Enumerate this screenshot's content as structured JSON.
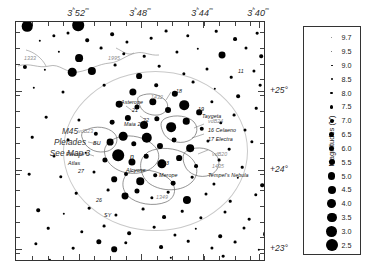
{
  "chart_data": {
    "type": "scatter",
    "xlabel": "Right Ascension",
    "ylabel": "Declination",
    "xlim": [
      "3h54m",
      "3h38m"
    ],
    "ylim": [
      "+22.6",
      "+25.6"
    ],
    "grid": false,
    "legend_position": "right",
    "ra_ticks": [
      "3h52m",
      "3h48m",
      "3h44m",
      "3h40m"
    ],
    "dec_ticks": [
      "+25°",
      "+24°",
      "+23°"
    ],
    "magnitude_scale": [
      9.7,
      9.5,
      9.0,
      8.5,
      8.0,
      7.5,
      7.0,
      6.5,
      6.0,
      5.5,
      5.0,
      4.5,
      4.0,
      3.5,
      3.0,
      2.5
    ],
    "stars": [
      {
        "x": 11,
        "y": 4,
        "mag": 3.6
      },
      {
        "x": 62,
        "y": 3,
        "mag": 2.9
      },
      {
        "x": 38,
        "y": 14,
        "mag": 8.6
      },
      {
        "x": 52,
        "y": 11,
        "mag": 8.8
      },
      {
        "x": 24,
        "y": 19,
        "mag": 9.2
      },
      {
        "x": 71,
        "y": 18,
        "mag": 8.4
      },
      {
        "x": 96,
        "y": 12,
        "mag": 8.3
      },
      {
        "x": 111,
        "y": 20,
        "mag": 8.7
      },
      {
        "x": 135,
        "y": 16,
        "mag": 9.0
      },
      {
        "x": 150,
        "y": 9,
        "mag": 8.9
      },
      {
        "x": 172,
        "y": 14,
        "mag": 8.5
      },
      {
        "x": 200,
        "y": 9,
        "mag": 9.1
      },
      {
        "x": 219,
        "y": 17,
        "mag": 8.2
      },
      {
        "x": 241,
        "y": 11,
        "mag": 9.0
      },
      {
        "x": 43,
        "y": 30,
        "mag": 9.3
      },
      {
        "x": 85,
        "y": 26,
        "mag": 8.9
      },
      {
        "x": 63,
        "y": 36,
        "mag": 5.5
      },
      {
        "x": 108,
        "y": 32,
        "mag": 8.5
      },
      {
        "x": 128,
        "y": 34,
        "mag": 9.1
      },
      {
        "x": 161,
        "y": 30,
        "mag": 8.7
      },
      {
        "x": 182,
        "y": 27,
        "mag": 9.2
      },
      {
        "x": 206,
        "y": 33,
        "mag": 6.1
      },
      {
        "x": 230,
        "y": 26,
        "mag": 8.8
      },
      {
        "x": 245,
        "y": 34,
        "mag": 8.4
      },
      {
        "x": 9,
        "y": 45,
        "mag": 8.0
      },
      {
        "x": 29,
        "y": 48,
        "mag": 9.3
      },
      {
        "x": 56,
        "y": 50,
        "mag": 5.0
      },
      {
        "x": 76,
        "y": 49,
        "mag": 5.2
      },
      {
        "x": 99,
        "y": 43,
        "mag": 8.9
      },
      {
        "x": 123,
        "y": 54,
        "mag": 6.9
      },
      {
        "x": 143,
        "y": 44,
        "mag": 9.0
      },
      {
        "x": 168,
        "y": 52,
        "mag": 8.6
      },
      {
        "x": 191,
        "y": 47,
        "mag": 8.8
      },
      {
        "x": 215,
        "y": 55,
        "mag": 9.1
      },
      {
        "x": 238,
        "y": 49,
        "mag": 8.7
      },
      {
        "x": 18,
        "y": 66,
        "mag": 9.2
      },
      {
        "x": 47,
        "y": 70,
        "mag": 8.8
      },
      {
        "x": 88,
        "y": 63,
        "mag": 9.0
      },
      {
        "x": 117,
        "y": 70,
        "mag": 5.9
      },
      {
        "x": 140,
        "y": 63,
        "mag": 8.4
      },
      {
        "x": 159,
        "y": 72,
        "mag": 6.5
      },
      {
        "x": 177,
        "y": 60,
        "mag": 8.9
      },
      {
        "x": 199,
        "y": 67,
        "mag": 9.2
      },
      {
        "x": 222,
        "y": 74,
        "mag": 8.3
      },
      {
        "x": 244,
        "y": 63,
        "mag": 9.0
      },
      {
        "x": 103,
        "y": 82,
        "mag": 6.3
      },
      {
        "x": 121,
        "y": 85,
        "mag": 7.4
      },
      {
        "x": 137,
        "y": 80,
        "mag": 5.8
      },
      {
        "x": 152,
        "y": 88,
        "mag": 6.8
      },
      {
        "x": 168,
        "y": 83,
        "mag": 4.3
      },
      {
        "x": 183,
        "y": 90,
        "mag": 7.0
      },
      {
        "x": 196,
        "y": 80,
        "mag": 8.6
      },
      {
        "x": 218,
        "y": 93,
        "mag": 8.9
      },
      {
        "x": 240,
        "y": 86,
        "mag": 9.1
      },
      {
        "x": 30,
        "y": 95,
        "mag": 9.0
      },
      {
        "x": 63,
        "y": 98,
        "mag": 8.7
      },
      {
        "x": 96,
        "y": 100,
        "mag": 7.6
      },
      {
        "x": 112,
        "y": 96,
        "mag": 6.6
      },
      {
        "x": 128,
        "y": 103,
        "mag": 5.4
      },
      {
        "x": 141,
        "y": 97,
        "mag": 7.2
      },
      {
        "x": 155,
        "y": 105,
        "mag": 4.2
      },
      {
        "x": 170,
        "y": 99,
        "mag": 6.4
      },
      {
        "x": 186,
        "y": 107,
        "mag": 7.8
      },
      {
        "x": 205,
        "y": 101,
        "mag": 8.5
      },
      {
        "x": 229,
        "y": 108,
        "mag": 8.8
      },
      {
        "x": 16,
        "y": 115,
        "mag": 9.1
      },
      {
        "x": 52,
        "y": 118,
        "mag": 8.9
      },
      {
        "x": 80,
        "y": 112,
        "mag": 7.9
      },
      {
        "x": 94,
        "y": 120,
        "mag": 6.2
      },
      {
        "x": 107,
        "y": 114,
        "mag": 4.9
      },
      {
        "x": 118,
        "y": 122,
        "mag": 7.1
      },
      {
        "x": 131,
        "y": 116,
        "mag": 3.7
      },
      {
        "x": 144,
        "y": 124,
        "mag": 6.7
      },
      {
        "x": 158,
        "y": 118,
        "mag": 7.5
      },
      {
        "x": 174,
        "y": 126,
        "mag": 5.6
      },
      {
        "x": 192,
        "y": 119,
        "mag": 8.7
      },
      {
        "x": 213,
        "y": 127,
        "mag": 9.0
      },
      {
        "x": 236,
        "y": 120,
        "mag": 8.6
      },
      {
        "x": 38,
        "y": 134,
        "mag": 8.8
      },
      {
        "x": 70,
        "y": 131,
        "mag": 9.2
      },
      {
        "x": 89,
        "y": 138,
        "mag": 7.3
      },
      {
        "x": 102,
        "y": 133,
        "mag": 2.9
      },
      {
        "x": 116,
        "y": 140,
        "mag": 6.0
      },
      {
        "x": 130,
        "y": 134,
        "mag": 7.7
      },
      {
        "x": 146,
        "y": 142,
        "mag": 4.5
      },
      {
        "x": 163,
        "y": 136,
        "mag": 6.9
      },
      {
        "x": 180,
        "y": 144,
        "mag": 8.2
      },
      {
        "x": 203,
        "y": 138,
        "mag": 8.9
      },
      {
        "x": 226,
        "y": 145,
        "mag": 9.1
      },
      {
        "x": 13,
        "y": 152,
        "mag": 9.0
      },
      {
        "x": 45,
        "y": 155,
        "mag": 8.5
      },
      {
        "x": 78,
        "y": 150,
        "mag": 8.8
      },
      {
        "x": 98,
        "y": 157,
        "mag": 7.0
      },
      {
        "x": 110,
        "y": 152,
        "mag": 8.1
      },
      {
        "x": 124,
        "y": 159,
        "mag": 5.7
      },
      {
        "x": 139,
        "y": 153,
        "mag": 8.4
      },
      {
        "x": 157,
        "y": 161,
        "mag": 7.6
      },
      {
        "x": 176,
        "y": 155,
        "mag": 9.0
      },
      {
        "x": 198,
        "y": 162,
        "mag": 8.7
      },
      {
        "x": 222,
        "y": 156,
        "mag": 9.2
      },
      {
        "x": 246,
        "y": 163,
        "mag": 8.3
      },
      {
        "x": 60,
        "y": 171,
        "mag": 9.1
      },
      {
        "x": 92,
        "y": 168,
        "mag": 8.9
      },
      {
        "x": 109,
        "y": 174,
        "mag": 6.1
      },
      {
        "x": 121,
        "y": 169,
        "mag": 7.4
      },
      {
        "x": 136,
        "y": 176,
        "mag": 8.6
      },
      {
        "x": 152,
        "y": 170,
        "mag": 9.0
      },
      {
        "x": 171,
        "y": 178,
        "mag": 5.3
      },
      {
        "x": 190,
        "y": 172,
        "mag": 8.8
      },
      {
        "x": 214,
        "y": 179,
        "mag": 9.1
      },
      {
        "x": 240,
        "y": 173,
        "mag": 8.5
      },
      {
        "x": 22,
        "y": 188,
        "mag": 8.4
      },
      {
        "x": 48,
        "y": 192,
        "mag": 9.2
      },
      {
        "x": 73,
        "y": 186,
        "mag": 9.0
      },
      {
        "x": 100,
        "y": 193,
        "mag": 8.7
      },
      {
        "x": 127,
        "y": 187,
        "mag": 8.9
      },
      {
        "x": 148,
        "y": 195,
        "mag": 8.2
      },
      {
        "x": 166,
        "y": 189,
        "mag": 9.1
      },
      {
        "x": 185,
        "y": 196,
        "mag": 8.6
      },
      {
        "x": 209,
        "y": 190,
        "mag": 8.8
      },
      {
        "x": 233,
        "y": 197,
        "mag": 9.0
      },
      {
        "x": 32,
        "y": 206,
        "mag": 9.1
      },
      {
        "x": 66,
        "y": 210,
        "mag": 8.5
      },
      {
        "x": 88,
        "y": 204,
        "mag": 8.9
      },
      {
        "x": 113,
        "y": 211,
        "mag": 8.3
      },
      {
        "x": 138,
        "y": 205,
        "mag": 9.0
      },
      {
        "x": 159,
        "y": 213,
        "mag": 8.7
      },
      {
        "x": 180,
        "y": 207,
        "mag": 9.2
      },
      {
        "x": 204,
        "y": 214,
        "mag": 8.4
      },
      {
        "x": 228,
        "y": 206,
        "mag": 8.8
      },
      {
        "x": 250,
        "y": 212,
        "mag": 6.9
      },
      {
        "x": 20,
        "y": 222,
        "mag": 8.6
      },
      {
        "x": 57,
        "y": 226,
        "mag": 9.0
      },
      {
        "x": 83,
        "y": 220,
        "mag": 7.2
      },
      {
        "x": 98,
        "y": 227,
        "mag": 7.0
      },
      {
        "x": 110,
        "y": 221,
        "mag": 8.5
      },
      {
        "x": 145,
        "y": 225,
        "mag": 8.2
      },
      {
        "x": 172,
        "y": 219,
        "mag": 9.1
      },
      {
        "x": 196,
        "y": 226,
        "mag": 8.7
      },
      {
        "x": 219,
        "y": 220,
        "mag": 8.9
      },
      {
        "x": 243,
        "y": 228,
        "mag": 9.2
      },
      {
        "x": 34,
        "y": 238,
        "mag": 9.3
      },
      {
        "x": 155,
        "y": 236,
        "mag": 9.2
      },
      {
        "x": 207,
        "y": 234,
        "mag": 9.0
      }
    ]
  },
  "axes": {
    "ra_ticks": [
      {
        "label": "3ʰ52ᵐ",
        "x": 63
      },
      {
        "label": "3ʰ48ᵐ",
        "x": 125
      },
      {
        "label": "3ʰ44ᵐ",
        "x": 187
      },
      {
        "label": "3ʰ40ᵐ",
        "x": 243
      }
    ],
    "dec_ticks": [
      {
        "label": "+25°",
        "y": 69
      },
      {
        "label": "+24°",
        "y": 148
      },
      {
        "label": "+23°",
        "y": 227
      }
    ]
  },
  "map_labels": {
    "object_title": [
      "M45",
      "Pleiades",
      "See Map 3"
    ],
    "nebulae": [
      {
        "name": "1333",
        "x": 8,
        "y": 33
      },
      {
        "name": "1995",
        "x": 92,
        "y": 33
      },
      {
        "name": "1432",
        "x": 135,
        "y": 72
      },
      {
        "name": "vdB23",
        "x": 62,
        "y": 106
      },
      {
        "name": "vdB24",
        "x": 192,
        "y": 96
      },
      {
        "name": "vdB20",
        "x": 196,
        "y": 129
      },
      {
        "name": "1435",
        "x": 196,
        "y": 141
      },
      {
        "name": "1349",
        "x": 140,
        "y": 172
      }
    ],
    "stars": [
      {
        "name": "11",
        "x": 222,
        "y": 46
      },
      {
        "name": "18",
        "x": 160,
        "y": 66
      },
      {
        "name": "Asterope",
        "x": 105,
        "y": 77
      },
      {
        "name": "21",
        "x": 116,
        "y": 85
      },
      {
        "name": "22",
        "x": 127,
        "y": 95
      },
      {
        "name": "19",
        "x": 182,
        "y": 84
      },
      {
        "name": "Taygeta",
        "x": 186,
        "y": 91
      },
      {
        "name": "Maia 20",
        "x": 108,
        "y": 99
      },
      {
        "name": "16 Celaeno",
        "x": 192,
        "y": 105
      },
      {
        "name": "17 Electra",
        "x": 192,
        "y": 114
      },
      {
        "name": "BU",
        "x": 77,
        "y": 118
      },
      {
        "name": "Pleione",
        "x": 50,
        "y": 129
      },
      {
        "name": "Atlas",
        "x": 52,
        "y": 138
      },
      {
        "name": "27",
        "x": 62,
        "y": 146
      },
      {
        "name": "η",
        "x": 114,
        "y": 131
      },
      {
        "name": "Alcyone",
        "x": 110,
        "y": 145
      },
      {
        "name": "23",
        "x": 147,
        "y": 138
      },
      {
        "name": "Merope",
        "x": 143,
        "y": 150
      },
      {
        "name": "Tempel's Nebula",
        "x": 192,
        "y": 150
      },
      {
        "name": "26",
        "x": 80,
        "y": 175
      },
      {
        "name": "SY",
        "x": 88,
        "y": 190
      }
    ]
  },
  "legend": {
    "title": "Magnitudes (V)",
    "entries": [
      {
        "value": "9.7",
        "size": 0.9
      },
      {
        "value": "9.5",
        "size": 1.2
      },
      {
        "value": "9.0",
        "size": 1.6
      },
      {
        "value": "8.5",
        "size": 2.1
      },
      {
        "value": "8.0",
        "size": 2.6
      },
      {
        "value": "7.5",
        "size": 3.2
      },
      {
        "value": "7.0",
        "size": 3.9
      },
      {
        "value": "6.5",
        "size": 4.6
      },
      {
        "value": "6.0",
        "size": 5.4
      },
      {
        "value": "5.5",
        "size": 6.2
      },
      {
        "value": "5.0",
        "size": 7.1
      },
      {
        "value": "4.5",
        "size": 8.0
      },
      {
        "value": "4.0",
        "size": 8.9
      },
      {
        "value": "3.5",
        "size": 9.8
      },
      {
        "value": "3.0",
        "size": 10.8
      },
      {
        "value": "2.5",
        "size": 11.8
      }
    ]
  }
}
